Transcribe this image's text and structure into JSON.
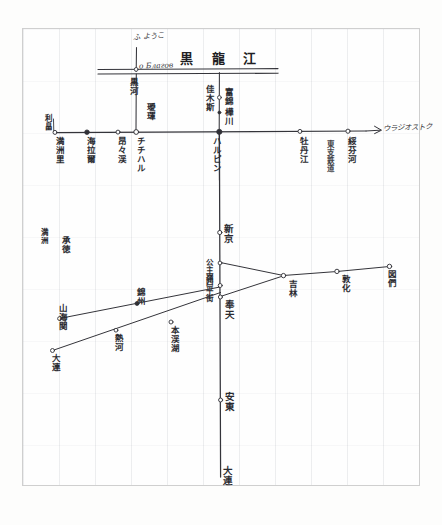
{
  "document": {
    "kind": "hand-drawn-sketch-map",
    "medium": "pencil on gridded paper",
    "title": "黒 龍 江",
    "title_note": "Heilongjiang / Amur river line, written across the top",
    "paper_color": "#fefefe",
    "ink_color": "#2b2b30",
    "grid_color": "#9a9faa"
  },
  "annotations": {
    "top_arrow_label": "ふ ようこ",
    "river_label_left": "о Благов",
    "river_name": "黒 龍 江",
    "river_suffix": "江"
  },
  "branch_top": {
    "left_vertical_label": "黒河",
    "left_vertical_label2": "璦琿",
    "right_vertical_label": "佳木斯",
    "right_station_1": "富錦",
    "right_station_2": "樺川"
  },
  "mainline_horizontal": {
    "left_end_label": "利畠",
    "right_arrow_label": "ウラジオストク",
    "stations": [
      {
        "name": "満洲里",
        "marker": "open",
        "x": 55
      },
      {
        "name": "海拉爾",
        "marker": "filled",
        "x": 87
      },
      {
        "name": "昂々渓",
        "marker": "open",
        "x": 118
      },
      {
        "name": "チチハル",
        "marker": "open",
        "x": 147
      },
      {
        "name": "ハルピン",
        "marker": "filled",
        "x": 218
      },
      {
        "name": "牡丹江",
        "marker": "open",
        "x": 300
      },
      {
        "name": "綏芬河",
        "marker": "open",
        "x": 355
      }
    ]
  },
  "mainline_vertical": {
    "label_junction": "新京",
    "label_mid": "公主嶺",
    "label_under_junction": "四平街",
    "stations": [
      {
        "name": "新京",
        "x": 222,
        "y": 232
      },
      {
        "name": "公主嶺",
        "x": 222,
        "y": 265
      },
      {
        "name": "四平街",
        "x": 222,
        "y": 284
      },
      {
        "name": "奉天",
        "x": 222,
        "y": 309
      },
      {
        "name": "安東",
        "x": 222,
        "y": 400
      }
    ],
    "bottom_label": "大連"
  },
  "branch_right": {
    "stations": [
      {
        "name": "吉林",
        "x": 283,
        "y": 282
      },
      {
        "name": "敦化",
        "x": 337,
        "y": 268
      },
      {
        "name": "図們",
        "x": 390,
        "y": 262
      }
    ]
  },
  "branch_southwest": {
    "left_end_label": "承徳",
    "stations": [
      {
        "name": "山海関",
        "x": 59,
        "y": 318
      },
      {
        "name": "錦州",
        "x": 137,
        "y": 305
      },
      {
        "name": "熱河",
        "x": 116,
        "y": 329
      },
      {
        "name": "本渓湖",
        "x": 171,
        "y": 323
      },
      {
        "name": "大連",
        "x": 52,
        "y": 349
      }
    ]
  },
  "left_margin_notes": {
    "note_1": "満洲",
    "note_2": "東支鉄道"
  }
}
